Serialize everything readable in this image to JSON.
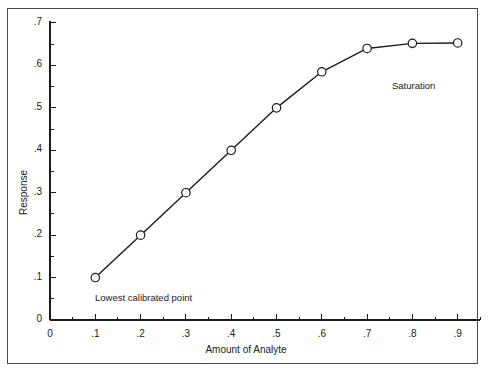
{
  "chart_data": {
    "type": "line",
    "title": "",
    "subtitle": "",
    "xlabel": "Amount of Analyte",
    "ylabel": "Response",
    "xlim": [
      0,
      0.95
    ],
    "ylim": [
      0,
      0.7
    ],
    "grid": false,
    "legend": "none",
    "marker": "open-circle",
    "line_color": "#1a1a1a",
    "marker_color": "#1a1a1a",
    "background": "#ffffff",
    "xticks": [
      0,
      0.1,
      0.2,
      0.3,
      0.4,
      0.5,
      0.6,
      0.7,
      0.8,
      0.9
    ],
    "xtick_labels": [
      "0",
      ".1",
      ".2",
      ".3",
      ".4",
      ".5",
      ".6",
      ".7",
      ".8",
      ".9"
    ],
    "x_minor_step": 0.05,
    "yticks": [
      0,
      0.1,
      0.2,
      0.3,
      0.4,
      0.5,
      0.6,
      0.7
    ],
    "ytick_labels": [
      "0",
      ".1",
      ".2",
      ".3",
      ".4",
      ".5",
      ".6",
      ".7"
    ],
    "y_minor_step": 0.05,
    "x": [
      0.1,
      0.2,
      0.3,
      0.4,
      0.5,
      0.6,
      0.7,
      0.8,
      0.9
    ],
    "values": [
      0.1,
      0.2,
      0.3,
      0.4,
      0.5,
      0.585,
      0.64,
      0.652,
      0.653
    ],
    "series": [
      {
        "name": "Calibration curve",
        "x": [
          0.1,
          0.2,
          0.3,
          0.4,
          0.5,
          0.6,
          0.7,
          0.8,
          0.9
        ],
        "values": [
          0.1,
          0.2,
          0.3,
          0.4,
          0.5,
          0.585,
          0.64,
          0.652,
          0.653
        ]
      }
    ],
    "annotations": [
      {
        "text": "Lowest calibrated point",
        "x": 0.1,
        "y": 0.06
      },
      {
        "text": "Saturation",
        "x": 0.77,
        "y": 0.565
      }
    ]
  },
  "annotations": {
    "lowest": "Lowest calibrated point",
    "saturation": "Saturation"
  }
}
